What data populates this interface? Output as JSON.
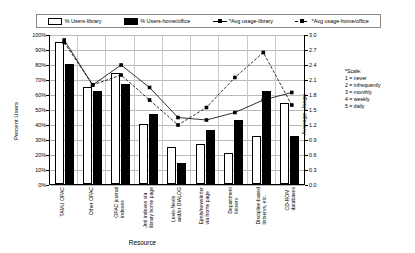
{
  "chart_data": {
    "type": "bar",
    "title": "",
    "xlabel": "Resource",
    "ylabel": "Percent Users",
    "y2label": "Average Usage",
    "ylim": [
      0,
      100
    ],
    "y2lim": [
      0,
      3.0
    ],
    "grid": true,
    "legend_position": "top",
    "categories": [
      "TAMU OPAC",
      "Other OPAC",
      "OPAC journal indexes",
      "Jrnl indexes via library home page",
      "Lexis-Nexis and/or DIALOG",
      "Ejrnls/newsletter via home page",
      "Department listserv",
      "Discipline-based listservs, etc.",
      "CD-ROM databases"
    ],
    "categories_wrapped": [
      [
        "TAMU OPAC"
      ],
      [
        "Other OPAC"
      ],
      [
        "OPAC journal",
        "indexes"
      ],
      [
        "Jrnl indexes via",
        "library home page"
      ],
      [
        "Lexis-Nexis",
        "and/or DIALOG"
      ],
      [
        "Ejrnls/newsletter",
        "via home page"
      ],
      [
        "Department",
        "listserv"
      ],
      [
        "Discipline-based",
        "listservs, etc."
      ],
      [
        "CD-ROM",
        "databases"
      ]
    ],
    "series": [
      {
        "name": "% Users-library",
        "axis": "left",
        "type": "bar",
        "style": "white",
        "values": [
          95,
          65,
          74,
          40,
          25,
          27,
          21,
          32,
          54
        ]
      },
      {
        "name": "% Users-home/office",
        "axis": "left",
        "type": "bar",
        "style": "black",
        "values": [
          80,
          62,
          67,
          47,
          14,
          36,
          43,
          62,
          32
        ]
      },
      {
        "name": "*Avg usage-library",
        "axis": "right",
        "type": "line",
        "style": "solid",
        "values": [
          2.9,
          2.0,
          2.4,
          1.95,
          1.35,
          1.3,
          1.45,
          1.7,
          1.85
        ]
      },
      {
        "name": "*Avg usage-home/office",
        "axis": "right",
        "type": "line",
        "style": "dashed",
        "values": [
          2.85,
          2.0,
          2.2,
          1.7,
          1.2,
          1.55,
          2.15,
          2.65,
          1.6
        ]
      }
    ],
    "yticks": [
      "0%",
      "10%",
      "20%",
      "30%",
      "40%",
      "50%",
      "60%",
      "70%",
      "80%",
      "90%",
      "100%"
    ],
    "y2ticks": [
      "0.0",
      "0.3",
      "0.6",
      "0.9",
      "1.2",
      "1.5",
      "1.8",
      "2.1",
      "2.4",
      "2.7",
      "3.0"
    ],
    "annotation": {
      "title": "*Scale:",
      "lines": [
        "1 = never",
        "2 = infrequently",
        "3 = monthly",
        "4 = weekly",
        "5 = daily"
      ]
    }
  },
  "legend": {
    "items": [
      {
        "label": "% Users-library",
        "swatch": "white-box-icon"
      },
      {
        "label": "% Users-home/office",
        "swatch": "black-box-icon"
      },
      {
        "label": "*Avg usage-library",
        "swatch": "solid-line-marker-icon"
      },
      {
        "label": "*Avg usage-home/office",
        "swatch": "dashed-line-marker-icon"
      }
    ]
  }
}
